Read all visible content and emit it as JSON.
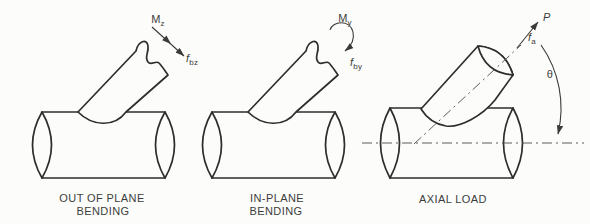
{
  "figure": {
    "background_color": "#fcfcfb",
    "line_color": "#2d2d2d",
    "text_color": "#3c3c3c",
    "panels": [
      {
        "id": "out-of-plane-bending",
        "caption_line1": "OUT OF PLANE",
        "caption_line2": "BENDING",
        "moment_label": {
          "main": "M",
          "sub": "z"
        },
        "stress_label": {
          "main": "f",
          "sub": "bz"
        }
      },
      {
        "id": "in-plane-bending",
        "caption_line1": "IN-PLANE",
        "caption_line2": "BENDING",
        "moment_label": {
          "main": "M",
          "sub": "y"
        },
        "stress_label": {
          "main": "f",
          "sub": "by"
        }
      },
      {
        "id": "axial-load",
        "caption_line1": "AXIAL LOAD",
        "load_label": "P",
        "stress_label": {
          "main": "f",
          "sub": "a"
        },
        "angle_label": "θ"
      }
    ]
  }
}
